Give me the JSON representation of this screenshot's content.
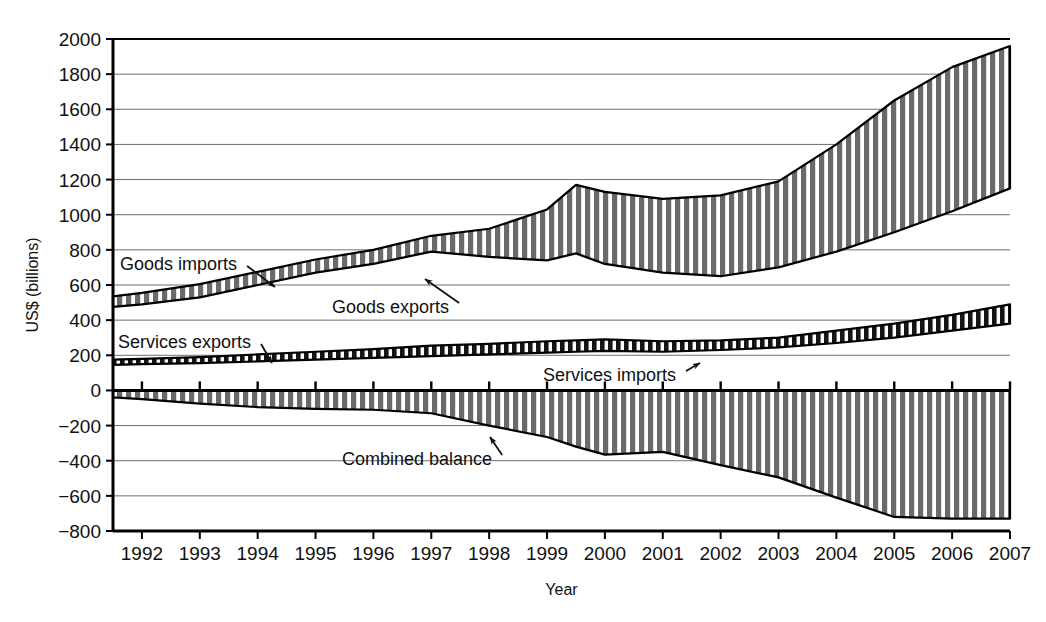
{
  "chart_data": {
    "type": "area",
    "title": "",
    "xlabel": "Year",
    "ylabel": "US$ (billions)",
    "xlim": [
      1991.5,
      2007
    ],
    "ylim": [
      -800,
      2000
    ],
    "grid": true,
    "legend_position": "inline-annotations",
    "x": [
      1991.5,
      1992,
      1993,
      1994,
      1995,
      1996,
      1997,
      1998,
      1999,
      1999.5,
      2000,
      2001,
      2002,
      2003,
      2004,
      2005,
      2006,
      2007
    ],
    "y_ticks": [
      -800,
      -600,
      -400,
      -200,
      0,
      200,
      400,
      600,
      800,
      1000,
      1200,
      1400,
      1600,
      1800,
      2000
    ],
    "x_ticks": [
      1992,
      1993,
      1994,
      1995,
      1996,
      1997,
      1998,
      1999,
      2000,
      2001,
      2002,
      2003,
      2004,
      2005,
      2006,
      2007
    ],
    "series": [
      {
        "name": "Goods imports",
        "values": [
          535,
          555,
          605,
          675,
          745,
          800,
          880,
          920,
          1030,
          1170,
          1130,
          1090,
          1110,
          1190,
          1400,
          1650,
          1840,
          1960
        ]
      },
      {
        "name": "Goods exports",
        "values": [
          475,
          490,
          530,
          600,
          670,
          720,
          790,
          760,
          740,
          780,
          720,
          670,
          650,
          700,
          790,
          900,
          1020,
          1150
        ]
      },
      {
        "name": "Services exports",
        "values": [
          175,
          180,
          190,
          205,
          220,
          235,
          255,
          265,
          280,
          285,
          290,
          280,
          285,
          300,
          340,
          380,
          430,
          490
        ]
      },
      {
        "name": "Services imports",
        "values": [
          145,
          150,
          155,
          165,
          175,
          185,
          195,
          205,
          215,
          220,
          225,
          220,
          230,
          245,
          270,
          300,
          340,
          380
        ]
      },
      {
        "name": "Combined balance",
        "values": [
          -40,
          -50,
          -75,
          -95,
          -105,
          -110,
          -130,
          -200,
          -265,
          -320,
          -365,
          -350,
          -425,
          -495,
          -610,
          -720,
          -730,
          -730
        ]
      }
    ],
    "annotations": [
      {
        "id": "goods-imports",
        "label": "Goods imports",
        "tx": 120,
        "ty": 270,
        "ax": 275,
        "ay": 287
      },
      {
        "id": "goods-exports",
        "label": "Goods exports",
        "tx": 332,
        "ty": 313,
        "ax": 425,
        "ay": 279
      },
      {
        "id": "services-exports",
        "label": "Services exports",
        "tx": 118,
        "ty": 348,
        "ax": 272,
        "ay": 363
      },
      {
        "id": "services-imports",
        "label": "Services imports",
        "tx": 543,
        "ty": 381,
        "ax": 700,
        "ay": 363
      },
      {
        "id": "combined-balance",
        "label": "Combined balance",
        "tx": 342,
        "ty": 465,
        "ax": 490,
        "ay": 437
      }
    ]
  }
}
